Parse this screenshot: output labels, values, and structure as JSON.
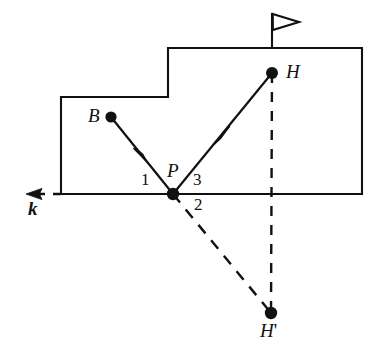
{
  "figure": {
    "background_color": "#ffffff",
    "stroke_color": "#111111",
    "points": [
      {
        "id": "B",
        "label": "B",
        "x": 111,
        "y": 117,
        "label_x": 88,
        "label_y": 108,
        "style": "filled-dot"
      },
      {
        "id": "P",
        "label": "P",
        "x": 173,
        "y": 194,
        "label_x": 168,
        "label_y": 163,
        "style": "filled-dot"
      },
      {
        "id": "H",
        "label": "H",
        "x": 272,
        "y": 73,
        "label_x": 285,
        "label_y": 64,
        "style": "filled-dot"
      },
      {
        "id": "H'",
        "label": "H",
        "prime": "'",
        "x": 271,
        "y": 313,
        "label_x": 261,
        "label_y": 323,
        "style": "filled-dot"
      }
    ],
    "segment_labels": [
      {
        "id": "seg-1",
        "label": "1",
        "x": 143,
        "y": 172
      },
      {
        "id": "seg-2",
        "label": "2",
        "x": 196,
        "y": 197
      },
      {
        "id": "seg-3",
        "label": "3",
        "x": 195,
        "y": 172
      }
    ],
    "axis_label": {
      "id": "k",
      "label": "k",
      "x": 28,
      "y": 200
    },
    "rays": [
      {
        "id": "incident-ray",
        "from": "B",
        "to": "P",
        "style": "solid",
        "arrow": "midpoint"
      },
      {
        "id": "reflected-ray",
        "from": "P",
        "to": "H",
        "style": "solid",
        "arrow": "midpoint"
      },
      {
        "id": "virtual-ray",
        "from": "P",
        "to": "H'",
        "style": "dashed",
        "arrow": "none"
      },
      {
        "id": "mirror-perpendicular",
        "from": "H",
        "to": "H'",
        "style": "dashed",
        "arrow": "none"
      }
    ],
    "mirror_line": {
      "id": "line-k",
      "y": 194,
      "x_start": 28,
      "x_end": 362,
      "dashed_until": 173,
      "arrow_end": "left"
    },
    "building_outline": {
      "id": "building",
      "description": "stepped rectangular building outline",
      "vertices": "61,97 168,97 168,48 362,48 362,194 61,194"
    },
    "flagpole": {
      "id": "flagpole",
      "x": 272,
      "top_y": 13,
      "bottom_y": 48,
      "pennant": {
        "width": 26,
        "height": 16,
        "filled": false
      }
    }
  }
}
